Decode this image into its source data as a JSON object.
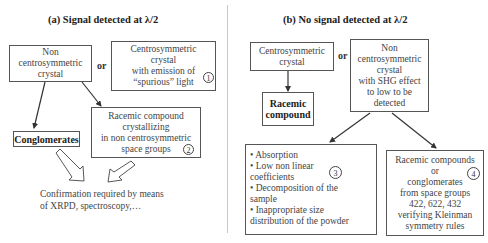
{
  "panel_a": {
    "title": "(a) Signal detected at λ/2",
    "box_noncentro": [
      "Non",
      "centrosymmetric",
      "crystal"
    ],
    "or_label": "or",
    "box_centro_spurious": [
      "Centrosymmetric",
      "crystal",
      "with emission of",
      "“spurious” light"
    ],
    "marker_1": "1",
    "box_conglomerates": "Conglomerates",
    "box_racemic": [
      "Racemic compound",
      "crystallizing",
      "in non centrosymmetric",
      "space groups"
    ],
    "marker_2": "2",
    "confirmation": [
      "Confirmation required by means",
      "of XRPD, spectroscopy,…"
    ]
  },
  "panel_b": {
    "title": "(b) No signal detected at λ/2",
    "box_centro": [
      "Centrosymmetric",
      "crystal"
    ],
    "or_label": "or",
    "box_noncentro_shg": [
      "Non",
      "centrosymmetric",
      "crystal",
      "with SHG effect",
      "to low to be",
      "detected"
    ],
    "box_racemic": [
      "Racemic",
      "compound"
    ],
    "box_reasons": [
      "• Absorption",
      "• Low non linear",
      "coefficients",
      "• Decomposition of the",
      "sample",
      "• Inappropriate size",
      "distribution of the powder"
    ],
    "marker_3": "3",
    "box_kleinman": [
      "Racemic compounds",
      "or",
      "conglomerates",
      "from space groups",
      "422, 622, 432",
      "verifying Kleinman",
      "symmetry rules"
    ],
    "marker_4": "4"
  }
}
